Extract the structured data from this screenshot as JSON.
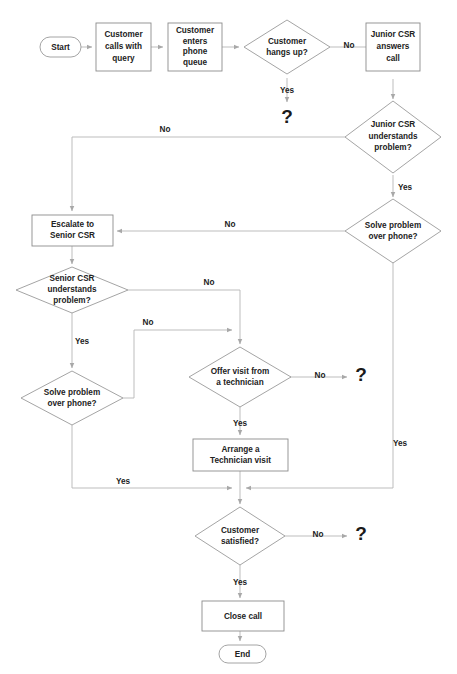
{
  "diagram": {
    "colors": {
      "background": "#ffffff",
      "shape_stroke": "#9a9a9a",
      "connector": "#b5b5b5",
      "text": "#222222"
    },
    "nodes": {
      "start": {
        "label": "Start",
        "type": "terminator"
      },
      "customer_calls": {
        "label": "Customer calls with query",
        "line1": "Customer",
        "line2": "calls with",
        "line3": "query",
        "type": "process"
      },
      "customer_queue": {
        "label": "Customer enters phone queue",
        "line1": "Customer",
        "line2": "enters",
        "line3": "phone",
        "line4": "queue",
        "type": "process"
      },
      "hangs_up": {
        "label": "Customer hangs up?",
        "line1": "Customer",
        "line2": "hangs up?",
        "type": "decision"
      },
      "junior_answers": {
        "label": "Junior CSR answers call",
        "line1": "Junior CSR",
        "line2": "answers",
        "line3": "call",
        "type": "process"
      },
      "junior_understands": {
        "label": "Junior CSR understands problem?",
        "line1": "Junior CSR",
        "line2": "understands",
        "line3": "problem?",
        "type": "decision"
      },
      "junior_solve": {
        "label": "Solve problem over phone?",
        "line1": "Solve problem",
        "line2": "over phone?",
        "type": "decision"
      },
      "escalate": {
        "label": "Escalate to Senior CSR",
        "line1": "Escalate to",
        "line2": "Senior CSR",
        "type": "process"
      },
      "senior_understands": {
        "label": "Senior CSR understands problem?",
        "line1": "Senior CSR",
        "line2": "understands",
        "line3": "problem?",
        "type": "decision"
      },
      "senior_solve": {
        "label": "Solve problem over phone?",
        "line1": "Solve problem",
        "line2": "over phone?",
        "type": "decision"
      },
      "offer_visit": {
        "label": "Offer visit from a technician",
        "line1": "Offer visit from",
        "line2": "a technician",
        "type": "decision"
      },
      "arrange_visit": {
        "label": "Arrange a Technician visit",
        "line1": "Arrange a",
        "line2": "Technician visit",
        "type": "process"
      },
      "customer_satisfied": {
        "label": "Customer satisfied?",
        "line1": "Customer",
        "line2": "satisfied?",
        "type": "decision"
      },
      "close_call": {
        "label": "Close call",
        "type": "process"
      },
      "end": {
        "label": "End",
        "type": "terminator"
      },
      "unknown_hangs_up": {
        "label": "?",
        "type": "unknown"
      },
      "unknown_offer_visit": {
        "label": "?",
        "type": "unknown"
      },
      "unknown_satisfied": {
        "label": "?",
        "type": "unknown"
      }
    },
    "edge_labels": {
      "hangs_up_yes": "Yes",
      "hangs_up_no": "No",
      "junior_understands_no": "No",
      "junior_understands_yes": "Yes",
      "junior_solve_no": "No",
      "junior_solve_yes": "Yes",
      "senior_understands_no": "No",
      "senior_understands_yes": "Yes",
      "senior_solve_no": "No",
      "senior_solve_yes": "Yes",
      "offer_visit_no": "No",
      "offer_visit_yes": "Yes",
      "satisfied_no": "No",
      "satisfied_yes": "Yes"
    }
  }
}
